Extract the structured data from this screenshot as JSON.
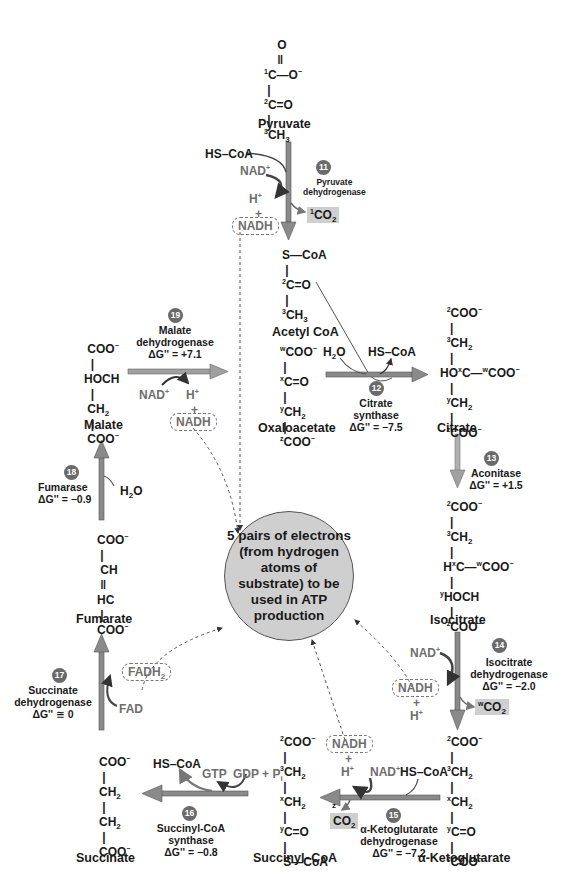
{
  "diagram": {
    "type": "metabolic-pathway",
    "title_hint": "Citric acid cycle (TCA cycle)",
    "center_node": "5 pairs of electrons (from hydrogen atoms of substrate) to be used in ATP production",
    "molecules": {
      "pyruvate": {
        "name": "Pyruvate",
        "lines": [
          "O",
          "1C—O⁻",
          "2C=O",
          "3CH3"
        ]
      },
      "acetyl_coa": {
        "name": "Acetyl CoA",
        "lines": [
          "S—CoA",
          "2C=O",
          "3CH3"
        ]
      },
      "oxaloacetate": {
        "name": "Oxaloacetate",
        "lines": [
          "wCOO⁻",
          "xC=O",
          "yCH2",
          "zCOO⁻"
        ]
      },
      "citrate": {
        "name": "Citrate",
        "lines": [
          "2COO⁻",
          "3CH2",
          "HOxC—wCOO⁻",
          "yCH2",
          "zCOO⁻"
        ]
      },
      "isocitrate": {
        "name": "Isocitrate",
        "lines": [
          "2COO⁻",
          "3CH2",
          "HxC—wCOO⁻",
          "yHOCH",
          "zCOO⁻"
        ]
      },
      "alpha_ketoglutarate": {
        "name": "α-Ketoglutarate",
        "lines": [
          "2COO⁻",
          "3CH2",
          "xCH2",
          "yC=O",
          "zCOO⁻"
        ]
      },
      "succinyl_coa": {
        "name": "Succinyl–CoA",
        "lines": [
          "2COO⁻",
          "3CH2",
          "xCH2",
          "yC=O",
          "S—CoA"
        ]
      },
      "succinate": {
        "name": "Succinate",
        "lines": [
          "COO⁻",
          "CH2",
          "CH2",
          "COO⁻"
        ]
      },
      "fumarate": {
        "name": "Fumarate",
        "lines": [
          "COO⁻",
          "CH",
          "HC",
          "COO⁻"
        ]
      },
      "malate": {
        "name": "Malate",
        "lines": [
          "COO⁻",
          "HOCH",
          "CH2",
          "COO⁻"
        ]
      }
    },
    "reactions": [
      {
        "step": "11",
        "enzyme": "Pyruvate dehydrogenase",
        "dG": "",
        "inputs": [
          "HS–CoA",
          "NAD⁺"
        ],
        "outputs": [
          "H⁺",
          "NADH",
          "1CO2"
        ]
      },
      {
        "step": "12",
        "enzyme": "Citrate synthase",
        "dG": "ΔG'' = −7.5",
        "inputs": [
          "H2O"
        ],
        "outputs": [
          "HS–CoA"
        ]
      },
      {
        "step": "13",
        "enzyme": "Aconitase",
        "dG": "ΔG'' = +1.5",
        "inputs": [],
        "outputs": []
      },
      {
        "step": "14",
        "enzyme": "Isocitrate dehydrogenase",
        "dG": "ΔG'' = −2.0",
        "inputs": [
          "NAD⁺"
        ],
        "outputs": [
          "NADH",
          "H⁺",
          "wCO2"
        ]
      },
      {
        "step": "15",
        "enzyme": "α-Ketoglutarate dehydrogenase",
        "dG": "ΔG'' = −7.2",
        "inputs": [
          "NAD⁺",
          "HS–CoA"
        ],
        "outputs": [
          "NADH",
          "H⁺",
          "zCO2"
        ]
      },
      {
        "step": "16",
        "enzyme": "Succinyl-CoA synthase",
        "dG": "ΔG'' = −0.8",
        "inputs": [
          "GDP + Pi"
        ],
        "outputs": [
          "GTP",
          "HS–CoA"
        ]
      },
      {
        "step": "17",
        "enzyme": "Succinate dehydrogenase",
        "dG": "ΔG'' ≅ 0",
        "inputs": [
          "FAD"
        ],
        "outputs": [
          "FADH2"
        ]
      },
      {
        "step": "18",
        "enzyme": "Fumarase",
        "dG": "ΔG'' = −0.9",
        "inputs": [
          "H2O"
        ],
        "outputs": []
      },
      {
        "step": "19",
        "enzyme": "Malate dehydrogenase",
        "dG": "ΔG'' = +7.1",
        "inputs": [
          "NAD⁺"
        ],
        "outputs": [
          "H⁺",
          "NADH"
        ]
      }
    ]
  },
  "labels": {
    "pyruvate": "Pyruvate",
    "acetyl_coa": "Acetyl CoA",
    "oxaloacetate": "Oxaloacetate",
    "citrate": "Citrate",
    "isocitrate": "Isocitrate",
    "alpha_kg": "α-Ketoglutarate",
    "succinyl_coa": "Succinyl–CoA",
    "succinate": "Succinate",
    "fumarate": "Fumarate",
    "malate": "Malate",
    "center": "5 pairs of electrons (from hydrogen atoms of substrate) to be used in ATP production",
    "hscoa": "HS–CoA",
    "nad": "NAD",
    "h": "H",
    "plus": "+",
    "nadh": "NADH",
    "co": "CO",
    "h2o_h": "H",
    "h2o_o": "O",
    "fad": "FAD",
    "fadh": "FADH",
    "gtp": "GTP",
    "gdp_pi": "GDP + P",
    "pi_sub": "i"
  },
  "steps": {
    "s11": {
      "num": "11",
      "enzyme_1": "Pyruvate",
      "enzyme_2": "dehydrogenase"
    },
    "s12": {
      "num": "12",
      "enzyme_1": "Citrate",
      "enzyme_2": "synthase",
      "dg": "ΔG'' = −7.5"
    },
    "s13": {
      "num": "13",
      "enzyme_1": "Aconitase",
      "dg": "ΔG'' = +1.5"
    },
    "s14": {
      "num": "14",
      "enzyme_1": "Isocitrate",
      "enzyme_2": "dehydrogenase",
      "dg": "ΔG'' = −2.0"
    },
    "s15": {
      "num": "15",
      "enzyme_1": "α-Ketoglutarate",
      "enzyme_2": "dehydrogenase",
      "dg": "ΔG'' = −7.2"
    },
    "s16": {
      "num": "16",
      "enzyme_1": "Succinyl-CoA",
      "enzyme_2": "synthase",
      "dg": "ΔG'' = −0.8"
    },
    "s17": {
      "num": "17",
      "enzyme_1": "Succinate",
      "enzyme_2": "dehydrogenase",
      "dg": "ΔG'' ≅ 0"
    },
    "s18": {
      "num": "18",
      "enzyme_1": "Fumarase",
      "dg": "ΔG'' = −0.9"
    },
    "s19": {
      "num": "19",
      "enzyme_1": "Malate",
      "enzyme_2": "dehydrogenase",
      "dg": "ΔG'' = +7.1"
    }
  },
  "colors": {
    "arrow": "#8a8a8a",
    "cofactor_text": "#6e6e6e",
    "co2_box": "#cfcfcf",
    "center_fill": "#cfcfcf",
    "badge": "#6a6a6a"
  }
}
